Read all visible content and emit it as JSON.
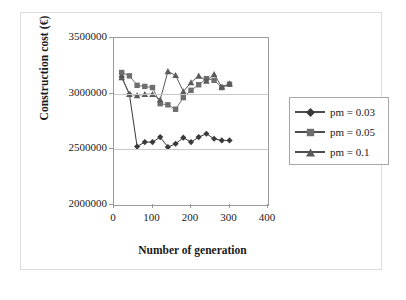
{
  "chart_data": {
    "type": "line",
    "title": "",
    "xlabel": "Number of generation",
    "ylabel": "Construction cost (€)",
    "xlim": [
      0,
      400
    ],
    "ylim": [
      2000000,
      3500000
    ],
    "xticks": [
      0,
      100,
      200,
      300,
      400
    ],
    "yticks": [
      2000000,
      2500000,
      3000000,
      3500000
    ],
    "ytick_labels": [
      "2000000",
      "2500000",
      "3000000",
      "3500000"
    ],
    "xtick_labels": [
      "0",
      "100",
      "200",
      "300",
      "400"
    ],
    "grid": true,
    "legend_position": "right",
    "series": [
      {
        "name": "pm = 0.03",
        "marker": "diamond",
        "color": "#3a3a3a",
        "x": [
          20,
          40,
          60,
          80,
          100,
          120,
          140,
          160,
          180,
          200,
          220,
          240,
          260,
          280,
          300
        ],
        "values": [
          3150000,
          2995000,
          2525000,
          2565000,
          2565000,
          2610000,
          2520000,
          2550000,
          2605000,
          2565000,
          2610000,
          2640000,
          2595000,
          2580000,
          2580000
        ]
      },
      {
        "name": "pm = 0.05",
        "marker": "square",
        "color": "#6e6e6e",
        "x": [
          20,
          40,
          60,
          80,
          100,
          120,
          140,
          160,
          180,
          200,
          220,
          240,
          260,
          280,
          300
        ],
        "values": [
          3190000,
          3160000,
          3075000,
          3065000,
          3055000,
          2910000,
          2900000,
          2860000,
          2965000,
          3030000,
          3080000,
          3135000,
          3120000,
          3055000,
          3085000
        ]
      },
      {
        "name": "pm = 0.1",
        "marker": "triangle",
        "color": "#5a5a5a",
        "x": [
          20,
          40,
          60,
          80,
          100,
          120,
          140,
          160,
          180,
          200,
          220,
          240,
          260,
          280,
          300
        ],
        "values": [
          3145000,
          2995000,
          2985000,
          2995000,
          2995000,
          2945000,
          3200000,
          3165000,
          3020000,
          3100000,
          3160000,
          3115000,
          3175000,
          3060000,
          3090000
        ]
      }
    ]
  },
  "legend": {
    "items": [
      {
        "label": "pm = 0.03"
      },
      {
        "label": "pm = 0.05"
      },
      {
        "label": "pm = 0.1"
      }
    ]
  }
}
